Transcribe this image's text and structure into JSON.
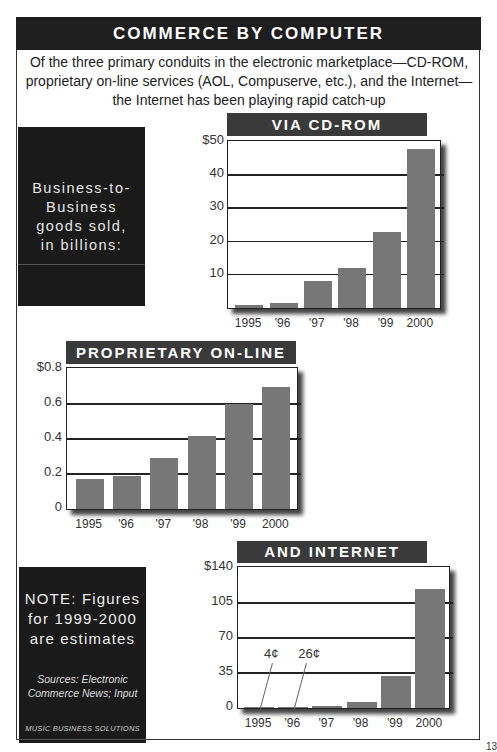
{
  "header": {
    "title": "COMMERCE BY COMPUTER",
    "subtitle_lines": [
      "Of the three primary conduits in the electronic marketplace—CD-ROM,",
      "proprietary on-line services (AOL, Compuserve, etc.), and the Internet—",
      "the Internet has been playing rapid catch-up"
    ]
  },
  "side": {
    "b2b_lines": [
      "Business-to-",
      "Business",
      "goods sold,",
      "in billions:"
    ],
    "note_lines": [
      "NOTE: Figures",
      "for 1999-2000",
      "are estimates"
    ],
    "sources_lines": [
      "Sources: Electronic",
      "Commerce News; Input"
    ],
    "brand": "MUSIC BUSINESS SOLUTIONS"
  },
  "colors": {
    "header_bg": "#1e1e1e",
    "title_bar_bg": "#3a3a3a",
    "bar": "#777777",
    "side_box_bg": "#1a1a1a"
  },
  "chart_data": [
    {
      "type": "bar",
      "title": "VIA CD-ROM",
      "ylabel": "Business-to-Business goods sold, in billions ($)",
      "categories": [
        "1995",
        "'96",
        "'97",
        "'98",
        "'99",
        "2000"
      ],
      "values": [
        1,
        1.5,
        8,
        12,
        23,
        48
      ],
      "yticks": [
        10,
        20,
        30,
        40,
        50
      ],
      "ytick_labels": [
        "10",
        "20",
        "30",
        "40",
        "$50"
      ],
      "ylim": [
        0,
        50
      ],
      "grid": true
    },
    {
      "type": "bar",
      "title": "PROPRIETARY ON-LINE",
      "ylabel": "Business-to-Business goods sold, in billions ($)",
      "categories": [
        "1995",
        "'96",
        "'97",
        "'98",
        "'99",
        "2000"
      ],
      "values": [
        0.17,
        0.19,
        0.29,
        0.42,
        0.6,
        0.7
      ],
      "yticks": [
        0,
        0.2,
        0.4,
        0.6,
        0.8
      ],
      "ytick_labels": [
        "0",
        "0.2",
        "0.4",
        "0.6",
        "$0.8"
      ],
      "ylim": [
        0,
        0.8
      ],
      "grid": true
    },
    {
      "type": "bar",
      "title": "AND INTERNET",
      "ylabel": "Business-to-Business goods sold, in billions ($)",
      "categories": [
        "1995",
        "'96",
        "'97",
        "'98",
        "'99",
        "2000"
      ],
      "values": [
        0.04,
        0.26,
        2,
        6,
        32,
        119
      ],
      "yticks": [
        0,
        35,
        70,
        105,
        140
      ],
      "ytick_labels": [
        "0",
        "35",
        "70",
        "105",
        "$140"
      ],
      "ylim": [
        0,
        140
      ],
      "grid": true,
      "annotations": [
        {
          "category": "1995",
          "text": "4¢"
        },
        {
          "category": "'96",
          "text": "26¢"
        }
      ]
    }
  ],
  "page_number": "13"
}
